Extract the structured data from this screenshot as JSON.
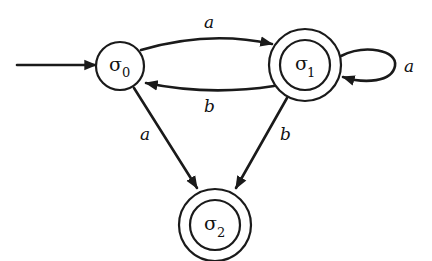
{
  "diagram": {
    "type": "finite-state-automaton",
    "states": [
      {
        "id": "s0",
        "symbol": "σ",
        "subscript": "0",
        "initial": true,
        "accepting": false
      },
      {
        "id": "s1",
        "symbol": "σ",
        "subscript": "1",
        "initial": false,
        "accepting": true
      },
      {
        "id": "s2",
        "symbol": "σ",
        "subscript": "2",
        "initial": false,
        "accepting": true
      }
    ],
    "transitions": [
      {
        "from": "s0",
        "to": "s1",
        "label": "a"
      },
      {
        "from": "s1",
        "to": "s0",
        "label": "b"
      },
      {
        "from": "s1",
        "to": "s1",
        "label": "a"
      },
      {
        "from": "s0",
        "to": "s2",
        "label": "a"
      },
      {
        "from": "s1",
        "to": "s2",
        "label": "b"
      }
    ],
    "colors": {
      "stroke": "#1a1a1a",
      "background": "#ffffff"
    }
  }
}
